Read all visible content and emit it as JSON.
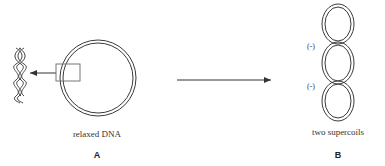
{
  "figure": {
    "panel_a": {
      "caption": "relaxed DNA",
      "label": "A"
    },
    "panel_b": {
      "caption": "two supercoils",
      "label": "B",
      "node_signs": [
        "(-)",
        "(-)"
      ]
    }
  },
  "colors": {
    "stroke": "#3a3a3a",
    "text": "#333333",
    "box": "#777777"
  }
}
